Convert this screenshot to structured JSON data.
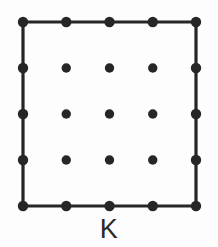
{
  "figure": {
    "name": "lattice-square-K",
    "label": "K",
    "canvas": {
      "width": 218,
      "height": 247
    },
    "background_color": "#fdfdfd",
    "stroke_color": "#262626",
    "dot_color": "#262626",
    "label_color": "#2b2b2b",
    "stroke_width": 3.2,
    "boundary_dot_radius": 5.2,
    "interior_dot_radius": 4.7,
    "square": {
      "left": 23,
      "top": 22,
      "right": 196,
      "bottom": 206,
      "width": 173,
      "height": 184
    },
    "grid": {
      "columns_x": [
        23,
        66.25,
        109.5,
        152.75,
        196
      ],
      "rows_y": [
        22,
        68,
        114,
        160,
        206
      ],
      "interior_x": [
        66.25,
        109.5,
        152.75
      ],
      "interior_y": [
        68,
        114,
        160
      ],
      "boundary_point_count": 16,
      "interior_point_count": 9,
      "total_point_count": 25
    },
    "outline_points": [
      {
        "x": 23,
        "y": 22
      },
      {
        "x": 196,
        "y": 22
      },
      {
        "x": 196,
        "y": 206
      },
      {
        "x": 23,
        "y": 206
      }
    ],
    "boundary_points": [
      {
        "x": 23,
        "y": 22
      },
      {
        "x": 66.25,
        "y": 22
      },
      {
        "x": 109.5,
        "y": 22
      },
      {
        "x": 152.75,
        "y": 22
      },
      {
        "x": 196,
        "y": 22
      },
      {
        "x": 196,
        "y": 68
      },
      {
        "x": 196,
        "y": 114
      },
      {
        "x": 196,
        "y": 160
      },
      {
        "x": 196,
        "y": 206
      },
      {
        "x": 152.75,
        "y": 206
      },
      {
        "x": 109.5,
        "y": 206
      },
      {
        "x": 66.25,
        "y": 206
      },
      {
        "x": 23,
        "y": 206
      },
      {
        "x": 23,
        "y": 160
      },
      {
        "x": 23,
        "y": 114
      },
      {
        "x": 23,
        "y": 68
      }
    ],
    "interior_points": [
      {
        "x": 66.25,
        "y": 68
      },
      {
        "x": 109.5,
        "y": 68
      },
      {
        "x": 152.75,
        "y": 68
      },
      {
        "x": 66.25,
        "y": 114
      },
      {
        "x": 109.5,
        "y": 114
      },
      {
        "x": 152.75,
        "y": 114
      },
      {
        "x": 66.25,
        "y": 160
      },
      {
        "x": 109.5,
        "y": 160
      },
      {
        "x": 152.75,
        "y": 160
      }
    ],
    "label_position": {
      "x": 109,
      "y": 216
    }
  }
}
